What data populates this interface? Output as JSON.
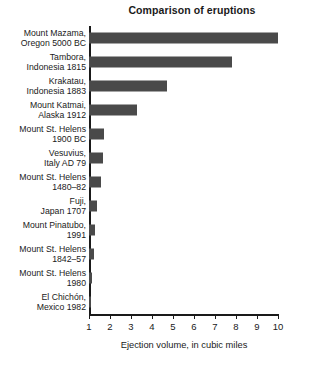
{
  "chart_data": {
    "type": "bar",
    "orientation": "horizontal",
    "title": "Comparison of eruptions",
    "xlabel": "Ejection volume, in cubic miles",
    "ylabel": "",
    "xlim": [
      1,
      10
    ],
    "xticks": [
      1,
      2,
      3,
      4,
      5,
      6,
      7,
      8,
      9,
      10
    ],
    "grid": false,
    "legend": null,
    "bar_color": "#4a4a4a",
    "categories": [
      "Mount Mazama, Oregon 5000 BC",
      "Tambora, Indonesia 1815",
      "Krakatau, Indonesia 1883",
      "Mount Katmai, Alaska 1912",
      "Mount St. Helens 1900 BC",
      "Vesuvius, Italy AD 79",
      "Mount St. Helens 1480–82",
      "Fuji, Japan 1707",
      "Mount Pinatubo, 1991",
      "Mount St. Helens 1842–57",
      "Mount St. Helens 1980",
      "El Chichón, Mexico 1982"
    ],
    "category_lines": [
      [
        "Mount Mazama,",
        "Oregon 5000 BC"
      ],
      [
        "Tambora,",
        "Indonesia 1815"
      ],
      [
        "Krakatau,",
        "Indonesia 1883"
      ],
      [
        "Mount Katmai,",
        "Alaska 1912"
      ],
      [
        "Mount St. Helens",
        "1900 BC"
      ],
      [
        "Vesuvius,",
        "Italy AD 79"
      ],
      [
        "Mount St. Helens",
        "1480–82"
      ],
      [
        "Fuji,",
        "Japan 1707"
      ],
      [
        "Mount Pinatubo,",
        "1991"
      ],
      [
        "Mount St. Helens",
        "1842–57"
      ],
      [
        "Mount St. Helens",
        "1980"
      ],
      [
        "El Chichón,",
        "Mexico 1982"
      ]
    ],
    "values": [
      10.0,
      7.8,
      4.7,
      3.3,
      1.72,
      1.66,
      1.56,
      1.36,
      1.28,
      1.22,
      1.12,
      1.05
    ]
  }
}
